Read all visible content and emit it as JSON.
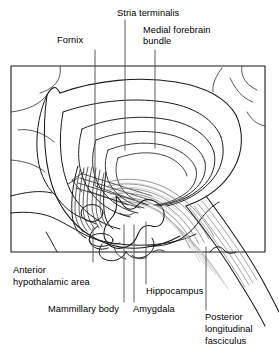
{
  "figure": {
    "type": "anatomical-line-drawing",
    "frame": {
      "x": 11,
      "y": 66,
      "width": 254,
      "height": 186,
      "stroke": "#1a1a1a"
    },
    "colors": {
      "ink": "#1a1a1a",
      "leader": "#4a4a4a",
      "fiber_light": "#9a9a9a",
      "background": "#ffffff"
    }
  },
  "labels": {
    "fornix": {
      "text": "Fornix",
      "x": 57,
      "y": 41
    },
    "stria_terminalis": {
      "text": "Stria terminalis",
      "x": 117,
      "y": 10
    },
    "medial_forebrain_bundle_line1": {
      "text": "Medial forebrain",
      "x": 143,
      "y": 28
    },
    "medial_forebrain_bundle_line2": {
      "text": "bundle",
      "x": 143,
      "y": 39
    },
    "anterior_hypothalamic_area_line1": {
      "text": "Anterior",
      "x": 13,
      "y": 269
    },
    "anterior_hypothalamic_area_line2": {
      "text": "hypothalamic area",
      "x": 13,
      "y": 281
    },
    "mammillary_body": {
      "text": "Mammillary body",
      "x": 48,
      "y": 308
    },
    "amygdala": {
      "text": "Amygdala",
      "x": 133,
      "y": 308
    },
    "hippocampus": {
      "text": "Hippocampus",
      "x": 146,
      "y": 290
    },
    "posterior_longitudinal_fasciculus_line1": {
      "text": "Posterior",
      "x": 205,
      "y": 316
    },
    "posterior_longitudinal_fasciculus_line2": {
      "text": "longitudinal",
      "x": 205,
      "y": 328
    },
    "posterior_longitudinal_fasciculus_line3": {
      "text": "fasciculus",
      "x": 205,
      "y": 340
    }
  },
  "leaders": {
    "fornix": {
      "x": 95,
      "y1": 50,
      "y2": 185
    },
    "stria_terminalis": {
      "x": 125,
      "y1": 20,
      "y2": 150
    },
    "medial_forebrain_bundle": {
      "x": 155,
      "y1": 50,
      "y2": 148
    },
    "anterior_hypothalamic_area": {
      "x": 93,
      "y1": 262,
      "y2": 228
    },
    "mammillary_body": {
      "x": 124,
      "y1": 302,
      "y2": 225
    },
    "amygdala": {
      "x": 134,
      "y1": 302,
      "y2": 225
    },
    "hippocampus": {
      "x": 146,
      "y1": 284,
      "y2": 222
    },
    "posterior_longitudinal_fasciculus": {
      "x": 206,
      "y1": 310,
      "y2": 247
    }
  }
}
